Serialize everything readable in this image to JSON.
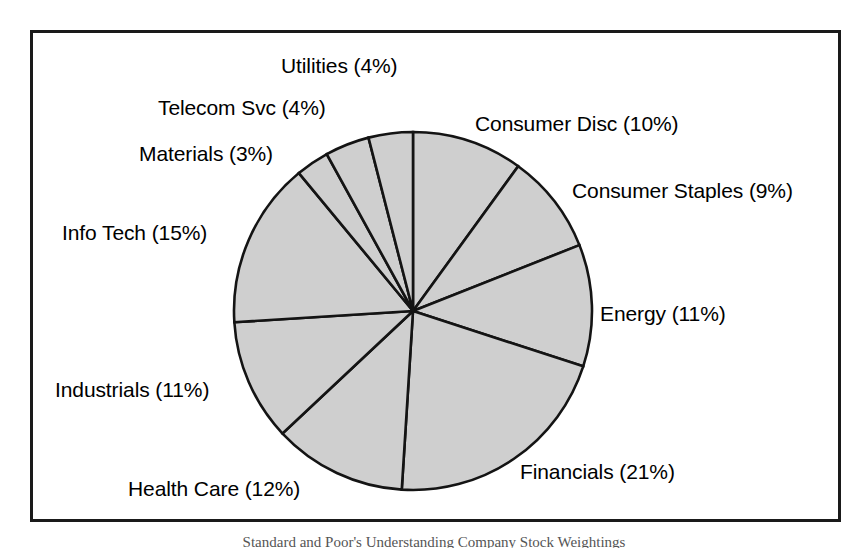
{
  "figure": {
    "name": "sector-weight-pie-chart",
    "frame": {
      "border_color": "#1a1a1a"
    },
    "caption": "Standard and Poor's Understanding Company Stock Weightings"
  },
  "chart_data": {
    "type": "pie",
    "title": "",
    "subtitle": "",
    "xlabel": "",
    "ylabel": "",
    "legend_position": "none",
    "grid": false,
    "start_angle_deg": 0,
    "direction": "clockwise",
    "slice_fill": "#cfcfcf",
    "slice_stroke": "#141414",
    "units": "percent",
    "total": 100,
    "categories": [
      "Consumer Disc",
      "Consumer Staples",
      "Energy",
      "Financials",
      "Health Care",
      "Industrials",
      "Info Tech",
      "Materials",
      "Telecom Svc",
      "Utilities"
    ],
    "values": [
      10,
      9,
      11,
      21,
      12,
      11,
      15,
      3,
      4,
      4
    ],
    "labels": [
      "Consumer Disc (10%)",
      "Consumer Staples (9%)",
      "Energy (11%)",
      "Financials (21%)",
      "Health Care (12%)",
      "Industrials (11%)",
      "Info Tech (15%)",
      "Materials (3%)",
      "Telecom Svc (4%)",
      "Utilities (4%)"
    ]
  },
  "labels": {
    "utilities": "Utilities (4%)",
    "telecom": "Telecom Svc (4%)",
    "materials": "Materials (3%)",
    "info_tech": "Info Tech (15%)",
    "industrials": "Industrials (11%)",
    "health_care": "Health Care (12%)",
    "financials": "Financials (21%)",
    "energy": "Energy (11%)",
    "consumer_staples": "Consumer Staples (9%)",
    "consumer_disc": "Consumer Disc (10%)"
  }
}
